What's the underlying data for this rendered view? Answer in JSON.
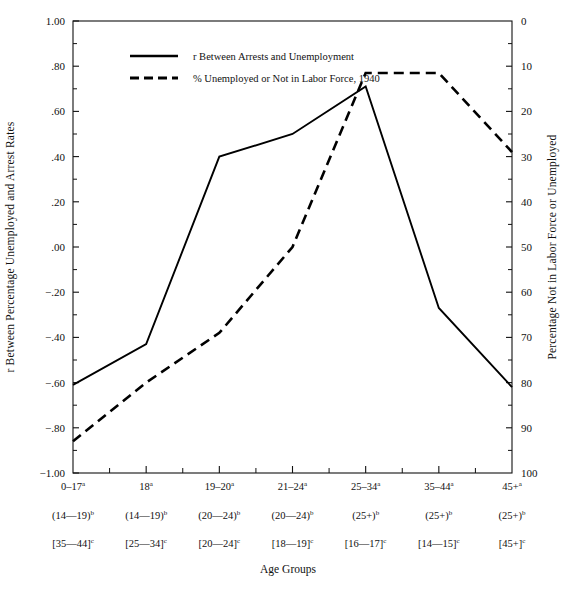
{
  "chart_data": {
    "type": "line",
    "title": "",
    "xlabel": "Age Groups",
    "ylabel": "r Between Percentage Unemployed and Arrest Rates",
    "y2label": "Percentage Not in Labor Force or Unemployed",
    "grid": false,
    "legend_position": "top-center",
    "categories": [
      "0–17",
      "18",
      "19–20",
      "21–24",
      "25–34",
      "35–44",
      "45+"
    ],
    "category_superscripts": [
      "a",
      "a",
      "a",
      "a",
      "a",
      "a",
      "a"
    ],
    "category_row2": [
      "(14—19)",
      "(14—19)",
      "(20—24)",
      "(20—24)",
      "(25+)",
      "(25+)",
      "(25+)"
    ],
    "category_row2_superscripts": [
      "b",
      "b",
      "b",
      "b",
      "b",
      "b",
      "b"
    ],
    "category_row3": [
      "[35—44]",
      "[25—34]",
      "[20—24]",
      "[18—19]",
      "[16—17]",
      "[14—15]",
      "[45+]"
    ],
    "category_row3_superscripts": [
      "c",
      "c",
      "c",
      "c",
      "c",
      "c",
      "c"
    ],
    "ylim": [
      -1.0,
      1.0
    ],
    "yticks": [
      1.0,
      0.8,
      0.6,
      0.4,
      0.2,
      0.0,
      -0.2,
      -0.4,
      -0.6,
      -0.8,
      -1.0
    ],
    "ytick_labels": [
      "1.00",
      ".80",
      ".60",
      ".40",
      ".20",
      ".00",
      "−.20",
      "−.40",
      "−.60",
      "−.80",
      "−1.00"
    ],
    "y2lim": [
      100,
      0
    ],
    "y2ticks": [
      0,
      10,
      20,
      30,
      40,
      50,
      60,
      70,
      80,
      90,
      100
    ],
    "y2tick_labels": [
      "0",
      "10",
      "20",
      "30",
      "40",
      "50",
      "60",
      "70",
      "80",
      "90",
      "100"
    ],
    "y2_inverted": true,
    "series": [
      {
        "name": "r Between Arrests and Unemployment",
        "style": "solid",
        "axis": "left",
        "values": [
          -0.61,
          -0.43,
          0.4,
          0.5,
          0.71,
          -0.27,
          -0.62
        ]
      },
      {
        "name": "% Unemployed or Not in Labor Force, 1940",
        "style": "dashed",
        "axis": "right",
        "values": [
          93.0,
          80.0,
          69.0,
          50.0,
          11.5,
          11.5,
          29.0
        ],
        "values_on_left_scale": [
          -0.86,
          -0.6,
          -0.38,
          0.0,
          0.77,
          0.77,
          0.42
        ]
      }
    ]
  },
  "legend": {
    "items": [
      {
        "label": "r Between Arrests and Unemployment",
        "style": "solid"
      },
      {
        "label": "% Unemployed or Not in Labor Force, 1940",
        "style": "dashed"
      }
    ]
  },
  "colors": {
    "line": "#000000",
    "axis": "#111111",
    "background": "#ffffff"
  }
}
